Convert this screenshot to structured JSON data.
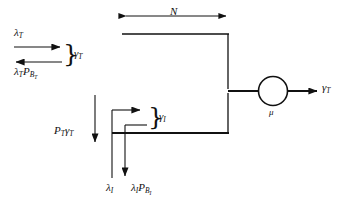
{
  "diagram": {
    "background": "#ffffff",
    "ink": "#111111",
    "width": 344,
    "height": 202
  },
  "queue": {
    "capacity_label": "N",
    "capacity_arrow": "double-headed-horizontal-arrow"
  },
  "server": {
    "rate_label": "μ",
    "shape": "circle"
  },
  "output": {
    "label_symbol": "γ",
    "label_sub": "T"
  },
  "streams": {
    "top": {
      "arrival_symbol": "λ",
      "arrival_sub": "T",
      "blocked_symbol": "λ",
      "blocked_sub": "T",
      "blocked_p": "P",
      "blocked_p_sub": "B",
      "blocked_p_sub2": "T",
      "net_symbol": "γ",
      "net_sub": "T",
      "brace": "}"
    },
    "feedback": {
      "p_symbol": "P",
      "p_sub": "T",
      "gamma_symbol": "γ",
      "gamma_sub": "T"
    },
    "bottom": {
      "arrival_symbol": "λ",
      "arrival_sub": "I",
      "blocked_symbol": "λ",
      "blocked_sub": "I",
      "blocked_p": "P",
      "blocked_p_sub": "B",
      "blocked_p_sub2": "I",
      "net_symbol": "γ",
      "net_sub": "I",
      "brace": "}"
    }
  }
}
